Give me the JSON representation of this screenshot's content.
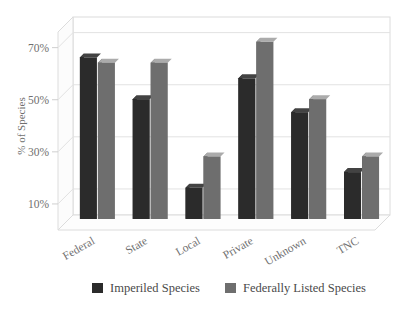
{
  "chart_data": {
    "type": "bar",
    "title": "",
    "subtitle": "",
    "xlabel": "",
    "ylabel": "% of Species",
    "categories": [
      "Federal",
      "State",
      "Local",
      "Private",
      "Unknown",
      "TNC"
    ],
    "series": [
      {
        "name": "Imperiled Species",
        "color": "#2b2b2b",
        "values": [
          62,
          46,
          12,
          54,
          41,
          18
        ]
      },
      {
        "name": "Federally Listed Species",
        "color": "#6e6e6e",
        "values": [
          60,
          60,
          24,
          68,
          46,
          24
        ]
      }
    ],
    "ylim": [
      0,
      76
    ],
    "ytick_values": [
      10,
      30,
      50,
      70
    ],
    "ytick_labels": [
      "10%",
      "30%",
      "50%",
      "70%"
    ],
    "grid": true,
    "grid_axis": "y",
    "legend_position": "bottom",
    "style": "3d-grayscale",
    "category_label_rotation": -30
  },
  "legend": {
    "items": [
      {
        "label": "Imperiled Species",
        "swatch": "#2b2b2b"
      },
      {
        "label": "Federally Listed Species",
        "swatch": "#6e6e6e"
      }
    ]
  },
  "axis": {
    "y_title": "% of Species"
  }
}
